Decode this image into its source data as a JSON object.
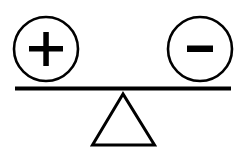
{
  "diagram": {
    "title": "Balance of positive and negative",
    "colors": {
      "stroke": "#000000",
      "background": "#ffffff"
    },
    "elements": {
      "left_pan": {
        "symbol": "plus",
        "label": "+"
      },
      "right_pan": {
        "symbol": "minus",
        "label": "−"
      },
      "beam": {
        "state": "level"
      },
      "fulcrum": {
        "shape": "triangle"
      }
    }
  }
}
